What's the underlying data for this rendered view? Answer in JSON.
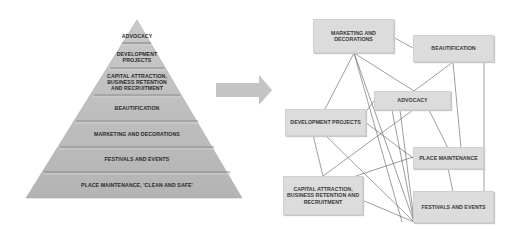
{
  "pyramid": {
    "tiers": [
      {
        "label": "ADVOCACY"
      },
      {
        "label": "DEVELOPMENT PROJECTS"
      },
      {
        "label": "CAPITAL ATTRACTION, BUSINESS RETENTION AND RECRUITMENT"
      },
      {
        "label": "BEAUTIFICATION"
      },
      {
        "label": "MARKETING AND DECORATIONS"
      },
      {
        "label": "FESTIVALS AND EVENTS"
      },
      {
        "label": "PLACE MAINTENANCE, 'CLEAN AND SAFE'"
      }
    ],
    "fill_color": "#bdbdbd",
    "separator_color": "#8a8a8a"
  },
  "arrow": {
    "direction": "right",
    "color": "#c4c4c4"
  },
  "network": {
    "nodes": [
      {
        "id": "marketing",
        "label": "MARKETING AND DECORATIONS"
      },
      {
        "id": "beautification",
        "label": "BEAUTIFICATION"
      },
      {
        "id": "advocacy",
        "label": "ADVOCACY"
      },
      {
        "id": "development",
        "label": "DEVELOPMENT PROJECTS"
      },
      {
        "id": "place",
        "label": "PLACE MAINTENANCE"
      },
      {
        "id": "capital",
        "label": "CAPITAL ATTRACTION, BUSINESS RETENTION AND RECRUITMENT"
      },
      {
        "id": "festivals",
        "label": "FESTIVALS AND EVENTS"
      }
    ],
    "edges": [
      [
        "marketing",
        "beautification"
      ],
      [
        "marketing",
        "development"
      ],
      [
        "marketing",
        "advocacy"
      ],
      [
        "marketing",
        "festivals"
      ],
      [
        "beautification",
        "advocacy"
      ],
      [
        "beautification",
        "place"
      ],
      [
        "beautification",
        "festivals"
      ],
      [
        "advocacy",
        "development"
      ],
      [
        "advocacy",
        "festivals"
      ],
      [
        "advocacy",
        "capital"
      ],
      [
        "advocacy",
        "place"
      ],
      [
        "development",
        "place"
      ],
      [
        "development",
        "capital"
      ],
      [
        "development",
        "festivals"
      ],
      [
        "capital",
        "place"
      ],
      [
        "capital",
        "festivals"
      ],
      [
        "place",
        "festivals"
      ]
    ],
    "node_color": "#dcdcdc",
    "line_color": "#555555"
  }
}
